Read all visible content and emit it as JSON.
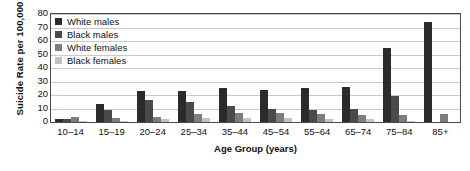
{
  "chart_data": {
    "type": "bar",
    "title": "",
    "xlabel": "Age Group (years)",
    "ylabel": "Suicide Rate per 100,000",
    "categories": [
      "10–14",
      "15–19",
      "20–24",
      "25–34",
      "35–44",
      "45–54",
      "55–64",
      "65–74",
      "75–84",
      "85+"
    ],
    "series": [
      {
        "name": "White males",
        "color": "#2b2b2b",
        "values": [
          2,
          13,
          23,
          23,
          25,
          24,
          25,
          26,
          55,
          74
        ]
      },
      {
        "name": "Black males",
        "color": "#4a4a4a",
        "values": [
          2,
          9,
          16,
          15,
          12,
          10,
          9,
          10,
          19,
          0
        ]
      },
      {
        "name": "White females",
        "color": "#7d7d7d",
        "values": [
          4,
          3,
          4,
          6,
          7,
          7,
          6,
          5,
          5,
          6
        ]
      },
      {
        "name": "Black females",
        "color": "#c2c2c2",
        "values": [
          1,
          1,
          2,
          3,
          3,
          3,
          2,
          2,
          1,
          0
        ]
      }
    ],
    "ylim": [
      0,
      80
    ],
    "yticks": [
      80,
      70,
      60,
      50,
      40,
      30,
      20,
      10,
      0
    ],
    "grid": true,
    "legend_position": "top-left"
  }
}
